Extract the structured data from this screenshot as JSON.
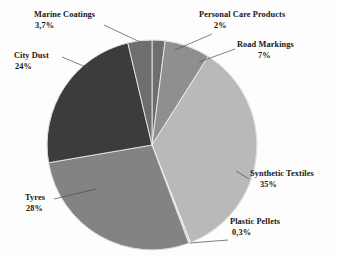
{
  "chart_data": {
    "type": "pie",
    "title": "",
    "subtitle": "",
    "xlabel": "",
    "ylabel": "",
    "legend_position": "none",
    "grid": false,
    "labels_outside": true,
    "decimal_separator": ",",
    "start_angle_deg": 0,
    "direction": "clockwise",
    "categories": [
      "Personal Care Products",
      "Road Markings",
      "Synthetic Textiles",
      "Plastic Pellets",
      "Tyres",
      "City Dust",
      "Marine Coatings"
    ],
    "values": [
      2,
      7,
      35,
      0.3,
      28,
      24,
      3.7
    ],
    "value_labels": [
      "2%",
      "7%",
      "35%",
      "0,3%",
      "28%",
      "24%",
      "3,7%"
    ],
    "colors": [
      "#6e6e6e",
      "#8f8f8f",
      "#b9b9b9",
      "#cfcfcf",
      "#838383",
      "#3c3c3c",
      "#6e6e6e"
    ],
    "slices": [
      {
        "name": "Personal Care Products",
        "value": 2,
        "value_label": "2%",
        "color": "#6e6e6e"
      },
      {
        "name": "Road Markings",
        "value": 7,
        "value_label": "7%",
        "color": "#8f8f8f"
      },
      {
        "name": "Synthetic Textiles",
        "value": 35,
        "value_label": "35%",
        "color": "#b9b9b9"
      },
      {
        "name": "Plastic Pellets",
        "value": 0.3,
        "value_label": "0,3%",
        "color": "#cfcfcf"
      },
      {
        "name": "Tyres",
        "value": 28,
        "value_label": "28%",
        "color": "#838383"
      },
      {
        "name": "City Dust",
        "value": 24,
        "value_label": "24%",
        "color": "#3c3c3c"
      },
      {
        "name": "Marine Coatings",
        "value": 3.7,
        "value_label": "3,7%",
        "color": "#6e6e6e"
      }
    ],
    "total": 100
  },
  "labels": {
    "marine": {
      "name": "Marine Coatings",
      "value": "3,7%"
    },
    "city": {
      "name": "City Dust",
      "value": "24%"
    },
    "tyres": {
      "name": "Tyres",
      "value": "28%"
    },
    "personal": {
      "name": "Personal Care Products",
      "value": "2%"
    },
    "road": {
      "name": "Road Markings",
      "value": "7%"
    },
    "synth": {
      "name": "Synthetic Textiles",
      "value": "35%"
    },
    "plastic": {
      "name": "Plastic Pellets",
      "value": "0,3%"
    }
  },
  "style": {
    "background": "#fdfdfd",
    "text_color": "#151515",
    "leader_line_color": "#4a4a4a",
    "slice_outline": "#f2f2f2"
  }
}
